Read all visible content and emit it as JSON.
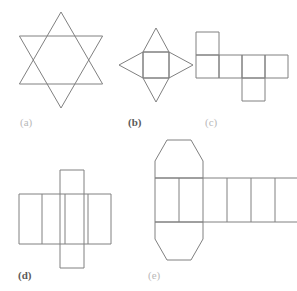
{
  "sheet": {
    "width": 297,
    "height": 291,
    "background": "#ffffff",
    "stroke_color": "#808080",
    "stroke_width": 1,
    "caption_color_light": "#b9b9b9",
    "caption_color_dark": "#5a5a5a"
  },
  "figures": [
    {
      "id": "a",
      "label": "(a)",
      "label_style": "light",
      "name": "six-pointed-star-hexagram",
      "description": "Six-pointed star formed by two overlapping equilateral triangles",
      "label_x": 20,
      "label_y": 117,
      "geometry": {
        "type": "hexagram",
        "center_x": 61,
        "center_y": 60,
        "outer_radius": 48,
        "triangle_up_points": "61,12 102.6,84 19.4,84",
        "triangle_down_points": "61,108 19.4,36 102.6,36"
      }
    },
    {
      "id": "b",
      "label": "(b)",
      "label_style": "dark",
      "name": "square-pyramid-net",
      "description": "Net of a square pyramid: central square with four triangles",
      "label_x": 128,
      "label_y": 117,
      "geometry": {
        "type": "pyramid-net",
        "square": {
          "x": 143,
          "y": 52,
          "size": 26
        },
        "apex_offset": 24,
        "square_points": "143,52 169,52 169,78 143,78",
        "triangle_top": "143,52 169,52 156,28",
        "triangle_bottom": "143,78 169,78 156,102",
        "triangle_left": "143,52 143,78 119,65",
        "triangle_right": "169,52 169,78 193,65"
      }
    },
    {
      "id": "c",
      "label": "(c)",
      "label_style": "light",
      "name": "cube-net-hexomino",
      "description": "Net of a cube: six unit squares in a staircase arrangement",
      "label_x": 205,
      "label_y": 117,
      "geometry": {
        "type": "square-grid-net",
        "cell": 23,
        "origin_x": 196,
        "origin_y": 32,
        "cells": [
          {
            "col": 0,
            "row": 0
          },
          {
            "col": 0,
            "row": 1
          },
          {
            "col": 1,
            "row": 1
          },
          {
            "col": 2,
            "row": 1
          },
          {
            "col": 3,
            "row": 1
          },
          {
            "col": 2,
            "row": 2
          }
        ]
      }
    },
    {
      "id": "d",
      "label": "(d)",
      "label_style": "dark",
      "name": "rectangular-prism-net",
      "description": "Net of a rectangular prism: a row of four rectangles crossed by a vertical rectangle",
      "label_x": 18,
      "label_y": 270,
      "geometry": {
        "type": "cross-net",
        "row": {
          "x": 19,
          "y": 194,
          "cell_w": 23,
          "cell_h": 50,
          "count": 4
        },
        "row_dividers_x": [
          42,
          65,
          88
        ],
        "column": {
          "x": 60,
          "y": 170,
          "w": 24,
          "h": 98
        }
      }
    },
    {
      "id": "e",
      "label": "(e)",
      "label_style": "light",
      "name": "hexagonal-prism-net",
      "description": "Net of a hexagonal prism: six rectangles in a row with two hexagons attached",
      "label_x": 148,
      "label_y": 270,
      "geometry": {
        "type": "hexagonal-prism-net",
        "row": {
          "x": 155,
          "y": 178,
          "cell_w": 24,
          "cell_h": 44,
          "count": 6
        },
        "row_dividers_x": [
          179,
          203,
          227,
          251,
          275
        ],
        "hexagon_top": "155,178 155,161 167,140 191,140 203,161 203,178",
        "hexagon_bottom": "155,222 155,239 167,260 191,260 203,239 203,222",
        "hexagon_width": 48,
        "hexagon_height": 38
      }
    }
  ]
}
